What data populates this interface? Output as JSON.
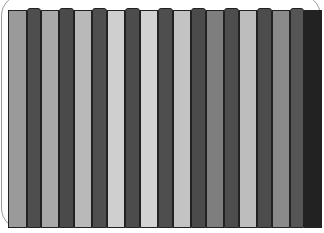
{
  "graphic": {
    "description": "Vertical grayscale strips",
    "strips": [
      {
        "x": 0,
        "w": 19,
        "color": "#9a9a9a",
        "raised": false
      },
      {
        "x": 19,
        "w": 14,
        "color": "#4e4e4e",
        "raised": true
      },
      {
        "x": 33,
        "w": 18,
        "color": "#a9a9a9",
        "raised": false
      },
      {
        "x": 51,
        "w": 15,
        "color": "#4a4a4a",
        "raised": true
      },
      {
        "x": 66,
        "w": 18,
        "color": "#b9b9b9",
        "raised": false
      },
      {
        "x": 84,
        "w": 15,
        "color": "#4f4f4f",
        "raised": true
      },
      {
        "x": 99,
        "w": 18,
        "color": "#cfcfcf",
        "raised": false
      },
      {
        "x": 117,
        "w": 15,
        "color": "#4c4c4c",
        "raised": true
      },
      {
        "x": 132,
        "w": 18,
        "color": "#d2d2d2",
        "raised": false
      },
      {
        "x": 150,
        "w": 15,
        "color": "#4e4e4e",
        "raised": true
      },
      {
        "x": 165,
        "w": 18,
        "color": "#c3c3c3",
        "raised": false
      },
      {
        "x": 183,
        "w": 15,
        "color": "#4b4b4b",
        "raised": true
      },
      {
        "x": 198,
        "w": 18,
        "color": "#7e7e7e",
        "raised": false
      },
      {
        "x": 216,
        "w": 15,
        "color": "#4d4d4d",
        "raised": true
      },
      {
        "x": 231,
        "w": 18,
        "color": "#bdbdbd",
        "raised": false
      },
      {
        "x": 249,
        "w": 15,
        "color": "#4c4c4c",
        "raised": true
      },
      {
        "x": 264,
        "w": 18,
        "color": "#8a8a8a",
        "raised": false
      },
      {
        "x": 282,
        "w": 14,
        "color": "#555555",
        "raised": true
      },
      {
        "x": 296,
        "w": 18,
        "color": "#222222",
        "raised": false
      }
    ]
  }
}
